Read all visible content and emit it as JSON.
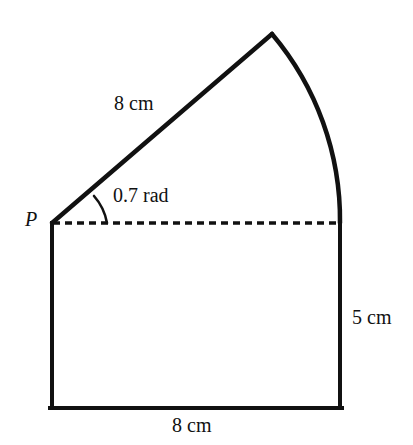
{
  "figure": {
    "stroke_color": "#111111",
    "background_color": "#ffffff",
    "labels": {
      "vertex_point": "P",
      "slant_length": "8 cm",
      "angle": "0.7 rad",
      "right_side_length": "5 cm",
      "base_length": "8 cm"
    },
    "geometry": {
      "vertex_p": {
        "x": 52,
        "y": 223
      },
      "apex": {
        "x": 272,
        "y": 33
      },
      "arc_end": {
        "x": 340,
        "y": 223
      },
      "rect_top_left": {
        "x": 52,
        "y": 223
      },
      "rect_bottom_left": {
        "x": 52,
        "y": 408
      },
      "rect_bottom_right": {
        "x": 340,
        "y": 408
      },
      "rect_top_right": {
        "x": 340,
        "y": 223
      },
      "sector_radius_px": 288,
      "sector_angle_rad": 0.7,
      "stroke_width": 4,
      "arc_stroke_width": 4,
      "dash_pattern": "7 5",
      "dash_stroke_width": 3.5
    }
  }
}
